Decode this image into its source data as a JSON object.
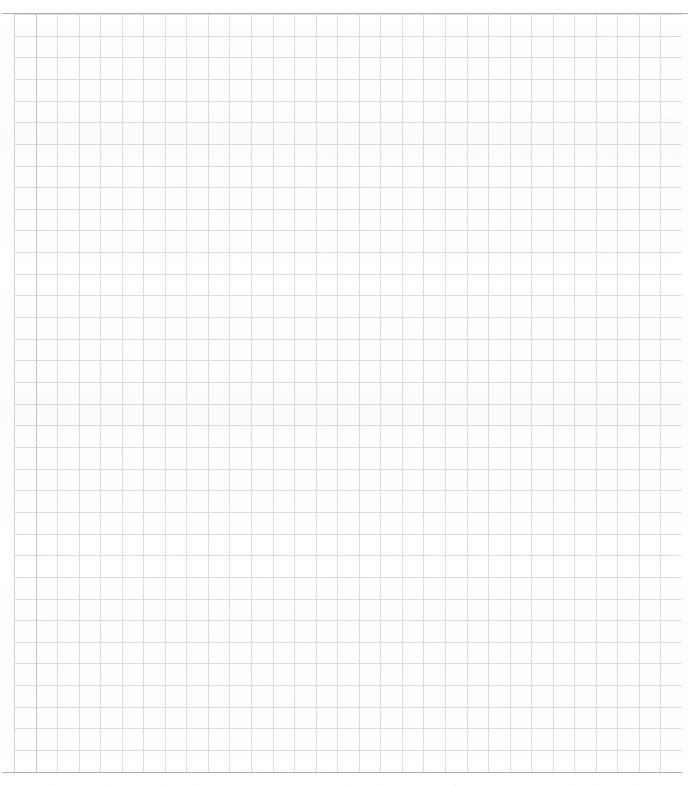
{
  "document": {
    "kind": "blank-grid-page",
    "title": "",
    "body_text": "",
    "annotations": [],
    "page_number": ""
  },
  "canvas": {
    "width": 688,
    "height": 786,
    "background_color": "#ffffff"
  },
  "grid": {
    "origin_x": 14,
    "origin_y": 14,
    "right_edge": 682,
    "bottom_edge": 772,
    "cell_width": 21.55,
    "cell_height": 21.65,
    "columns": 31,
    "rows": 35,
    "minor_line_color": "#dcdde0",
    "minor_line_width": 1,
    "major_line_color": "#c8c9cd"
  },
  "borders": {
    "top": {
      "label": "top-rule",
      "x": 2,
      "y": 13,
      "length": 686,
      "color": "#b0b1b5",
      "thickness": 1
    },
    "bottom": {
      "label": "bottom-rule",
      "x": 2,
      "y": 772,
      "length": 680,
      "color": "#aeafb3",
      "thickness": 1
    },
    "left_outer": {
      "label": "left-margin-rule",
      "x": 14,
      "y": 14,
      "length": 758,
      "color": "#d2d3d6",
      "thickness": 1
    },
    "left_inner": {
      "label": "left-second-rule",
      "x": 36,
      "y": 14,
      "length": 758,
      "color": "#c2c3c7",
      "thickness": 1
    }
  },
  "colors": {
    "paper": "#ffffff",
    "grid_light": "#dcdde0",
    "grid_medium": "#c8c9cd",
    "grid_dark": "#b0b1b5"
  }
}
